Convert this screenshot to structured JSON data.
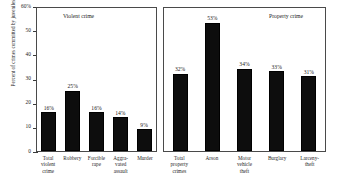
{
  "chart_data": {
    "type": "bar",
    "title": "",
    "subtitle": "",
    "xlabel": "",
    "ylabel": "Percent of crimes committed by juveniles",
    "ylim": [
      0,
      60
    ],
    "ytick_labels": [
      "60%",
      "50",
      "40",
      "30",
      "20",
      "10",
      "0"
    ],
    "ytick_values": [
      60,
      50,
      40,
      30,
      20,
      10,
      0
    ],
    "grid": false,
    "legend_position": "none",
    "bar_color": "#0d0d0d",
    "panels": [
      {
        "name": "violent",
        "title": "Violent crime",
        "categories": [
          "Total violent crime",
          "Robbery",
          "Forcible rape",
          "Aggravated assault",
          "Murder"
        ],
        "category_lines": [
          [
            "Total",
            "violent",
            "crime"
          ],
          [
            "Robbery"
          ],
          [
            "Forcible",
            "rape"
          ],
          [
            "Aggra-",
            "vated",
            "assault"
          ],
          [
            "Murder"
          ]
        ],
        "values": [
          16,
          25,
          16,
          14,
          9
        ],
        "value_labels": [
          "16%",
          "25%",
          "16%",
          "14%",
          "9%"
        ]
      },
      {
        "name": "property",
        "title": "Property crime",
        "categories": [
          "Total property crimes",
          "Arson",
          "Motor vehicle theft",
          "Burglary",
          "Larceny-theft"
        ],
        "category_lines": [
          [
            "Total",
            "property",
            "crimes"
          ],
          [
            "Arson"
          ],
          [
            "Motor",
            "vehicle",
            "theft"
          ],
          [
            "Burglary"
          ],
          [
            "Larceny-",
            "theft"
          ]
        ],
        "values": [
          32,
          53,
          34,
          33,
          31
        ],
        "value_labels": [
          "32%",
          "53%",
          "34%",
          "33%",
          "31%"
        ]
      }
    ]
  }
}
